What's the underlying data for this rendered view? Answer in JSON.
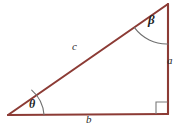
{
  "figure": {
    "type": "right-triangle-diagram",
    "background_color": "#ffffff",
    "stroke_color": "#8c3b35",
    "arc_color": "#6f6f6f",
    "right_angle_color": "#7a7a7a",
    "text_color": "#2b2b2b"
  },
  "vertices": {
    "left": {
      "label": "left-vertex",
      "x": 8,
      "y": 115
    },
    "top_right": {
      "label": "top-right-vertex",
      "x": 168,
      "y": 4
    },
    "bottom_right": {
      "label": "bottom-right-vertex",
      "x": 168,
      "y": 114
    }
  },
  "sides": [
    {
      "id": "hypotenuse",
      "label": "c",
      "position": "upper-left",
      "from": "left",
      "to": "top_right"
    },
    {
      "id": "opposite",
      "label": "a",
      "position": "right",
      "from": "top_right",
      "to": "bottom_right"
    },
    {
      "id": "adjacent",
      "label": "b",
      "position": "bottom",
      "from": "left",
      "to": "bottom_right"
    }
  ],
  "angles": [
    {
      "id": "theta",
      "label": "θ",
      "vertex": "left",
      "marker": "arc"
    },
    {
      "id": "beta",
      "label": "β",
      "vertex": "top_right",
      "marker": "arc"
    },
    {
      "id": "right",
      "label": "",
      "vertex": "bottom_right",
      "marker": "square"
    }
  ]
}
